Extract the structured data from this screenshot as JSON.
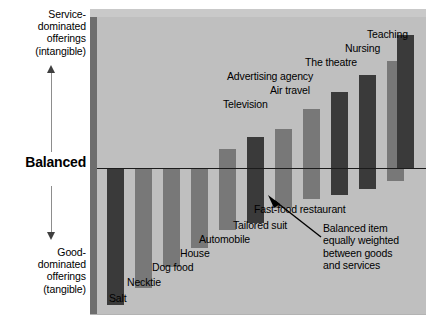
{
  "axis": {
    "top_label": "Service-\ndominated\nofferings\n(intangible)",
    "top_label_lines": [
      "Service-",
      "dominated",
      "offerings",
      "(intangible)"
    ],
    "center_label": "Balanced",
    "bottom_label_lines": [
      "Good-",
      "dominated",
      "offerings",
      "(tangible)"
    ],
    "up_arrow": "up-arrow-icon",
    "down_arrow": "down-arrow-icon"
  },
  "annotation": {
    "lines": [
      "Balanced item",
      "equally weighted",
      "between goods",
      "and services"
    ],
    "arrow": "pointer-arrow-icon"
  },
  "colors": {
    "plot_background": "#bfbfbf",
    "bar_dark": "#3a3a3a",
    "bar_light": "#787878",
    "baseline": "#1b1b1b",
    "panel_edge": "#6e6e6e",
    "panel_top": "#c9c9c9"
  },
  "chart_data": {
    "type": "bar",
    "title": "",
    "xlabel": "",
    "ylabel": "Balanced",
    "ylim": [
      -100,
      100
    ],
    "grid": false,
    "legend": "none",
    "axis_top_annotation": "Service-dominated offerings (intangible)",
    "axis_bottom_annotation": "Good-dominated offerings (tangible)",
    "baseline_label": "Balanced",
    "note": "Balanced item equally weighted between goods and services",
    "categories": [
      "Salt",
      "Necktie",
      "Dog food",
      "House",
      "Automobile",
      "Tailored suit",
      "Fast-food restaurant",
      "Television",
      "Air travel",
      "Advertising agency",
      "The theatre",
      "Nursing",
      "Teaching",
      ""
    ],
    "values": [
      -80,
      -72,
      -60,
      -50,
      13,
      -45,
      8,
      23,
      36,
      52,
      60,
      74,
      88,
      96
    ],
    "bars": [
      {
        "label": "Salt",
        "x": 10,
        "w": 17,
        "top": 152,
        "bottom": 288,
        "color": "#3a3a3a",
        "direction": "down"
      },
      {
        "label": "Necktie",
        "x": 38,
        "w": 17,
        "top": 152,
        "bottom": 271,
        "color": "#787878",
        "direction": "down"
      },
      {
        "label": "Dog food",
        "x": 66,
        "w": 17,
        "top": 152,
        "bottom": 250,
        "color": "#787878",
        "direction": "down"
      },
      {
        "label": "House",
        "x": 94,
        "w": 17,
        "top": 152,
        "bottom": 231,
        "color": "#787878",
        "direction": "down"
      },
      {
        "label": "Automobile",
        "x": 122,
        "w": 17,
        "top": 132,
        "bottom": 152,
        "color": "#787878",
        "direction": "up"
      },
      {
        "label": "Automobile-lower",
        "x": 122,
        "w": 17,
        "top": 152,
        "bottom": 213,
        "color": "#787878",
        "direction": "down"
      },
      {
        "label": "Tailored suit",
        "x": 150,
        "w": 17,
        "top": 120,
        "bottom": 152,
        "color": "#3a3a3a",
        "direction": "up"
      },
      {
        "label": "Tailored suit-lower",
        "x": 150,
        "w": 17,
        "top": 152,
        "bottom": 206,
        "color": "#3a3a3a",
        "direction": "down"
      },
      {
        "label": "Fast-food restaurant",
        "x": 178,
        "w": 17,
        "top": 112,
        "bottom": 152,
        "color": "#787878",
        "direction": "up"
      },
      {
        "label": "Fast-food-lower",
        "x": 178,
        "w": 17,
        "top": 152,
        "bottom": 191,
        "color": "#787878",
        "direction": "down"
      },
      {
        "label": "Television",
        "x": 206,
        "w": 17,
        "top": 92,
        "bottom": 152,
        "color": "#787878",
        "direction": "up"
      },
      {
        "label": "Television-lower",
        "x": 206,
        "w": 17,
        "top": 152,
        "bottom": 182,
        "color": "#787878",
        "direction": "down"
      },
      {
        "label": "Air travel",
        "x": 234,
        "w": 17,
        "top": 75,
        "bottom": 152,
        "color": "#3a3a3a",
        "direction": "up"
      },
      {
        "label": "Air travel-lower",
        "x": 234,
        "w": 17,
        "top": 152,
        "bottom": 178,
        "color": "#3a3a3a",
        "direction": "down"
      },
      {
        "label": "Advertising agency",
        "x": 262,
        "w": 17,
        "top": 58,
        "bottom": 152,
        "color": "#3a3a3a",
        "direction": "up"
      },
      {
        "label": "Advertising-lower",
        "x": 262,
        "w": 17,
        "top": 152,
        "bottom": 172,
        "color": "#3a3a3a",
        "direction": "down"
      },
      {
        "label": "The theatre",
        "x": 290,
        "w": 17,
        "top": 44,
        "bottom": 152,
        "color": "#787878",
        "direction": "up"
      },
      {
        "label": "The theatre-lower",
        "x": 290,
        "w": 17,
        "top": 152,
        "bottom": 164,
        "color": "#787878",
        "direction": "down"
      },
      {
        "label": "Nursing",
        "x": 300,
        "w": 17,
        "top": 30,
        "bottom": 152,
        "color": "#787878",
        "direction": "up"
      },
      {
        "label": "Teaching",
        "x": 300,
        "w": 17,
        "top": 18,
        "bottom": 152,
        "color": "#3a3a3a",
        "direction": "up"
      }
    ],
    "bar_labels": [
      {
        "text": "Salt",
        "x": 12,
        "y": 276
      },
      {
        "text": "Necktie",
        "x": 30,
        "y": 260
      },
      {
        "text": "Dog food",
        "x": 55,
        "y": 245
      },
      {
        "text": "House",
        "x": 83,
        "y": 231
      },
      {
        "text": "Automobile",
        "x": 102,
        "y": 217
      },
      {
        "text": "Tailored suit",
        "x": 136,
        "y": 203
      },
      {
        "text": "Fast-food restaurant",
        "x": 157,
        "y": 187
      },
      {
        "text": "Television",
        "x": 126,
        "y": 82
      },
      {
        "text": "Air travel",
        "x": 173,
        "y": 68
      },
      {
        "text": "Advertising agency",
        "x": 130,
        "y": 54
      },
      {
        "text": "The theatre",
        "x": 208,
        "y": 40
      },
      {
        "text": "Nursing",
        "x": 248,
        "y": 26
      },
      {
        "text": "Teaching",
        "x": 270,
        "y": 12
      }
    ]
  }
}
